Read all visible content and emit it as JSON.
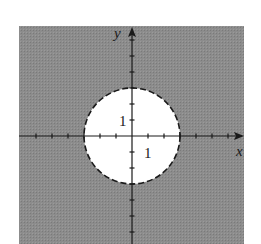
{
  "chart_data": {
    "type": "region",
    "title": "",
    "inequality": "x^2 + y^2 > 9",
    "boundary": {
      "shape": "circle",
      "center": [
        0,
        0
      ],
      "radius": 3,
      "style": "dashed"
    },
    "shaded": "outside",
    "xlabel": "x",
    "ylabel": "y",
    "xlim": [
      -7,
      7
    ],
    "ylim": [
      -7,
      7
    ],
    "tick_spacing": 1,
    "tick_labels": {
      "x": [
        "1"
      ],
      "y": [
        "1"
      ]
    },
    "colors": {
      "shade": "#8a8a8a",
      "inside": "#ffffff",
      "axis": "#1a1a1a"
    },
    "grid": false
  },
  "labels": {
    "x_axis": "x",
    "y_axis": "y",
    "x_tick_1": "1",
    "y_tick_1": "1"
  }
}
